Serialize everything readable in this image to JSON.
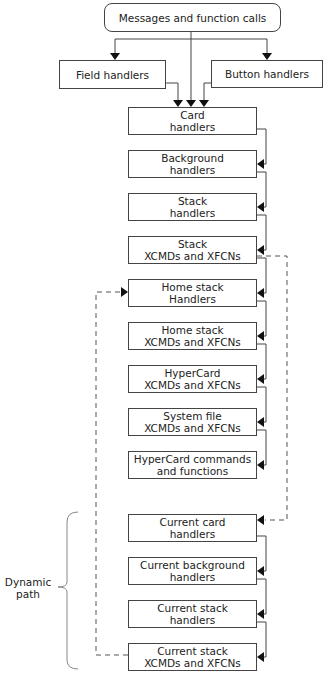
{
  "diagram": {
    "source": {
      "label": "Messages and function calls",
      "x": 104,
      "y": 3,
      "w": 177,
      "h": 29
    },
    "side_nodes": [
      {
        "id": "field",
        "label": "Field handlers",
        "x": 59,
        "y": 60,
        "w": 107,
        "h": 29
      },
      {
        "id": "button",
        "label": "Button handlers",
        "x": 211,
        "y": 60,
        "w": 112,
        "h": 28
      }
    ],
    "static_path": [
      {
        "id": "card",
        "label": "Card\nhandlers",
        "y": 107
      },
      {
        "id": "background",
        "label": "Background\nhandlers",
        "y": 150
      },
      {
        "id": "stack",
        "label": "Stack\nhandlers",
        "y": 193
      },
      {
        "id": "stack-xcmds",
        "label": "Stack\nXCMDs and XFCNs",
        "y": 236
      },
      {
        "id": "home-handlers",
        "label": "Home stack\nHandlers",
        "y": 279
      },
      {
        "id": "home-xcmds",
        "label": "Home stack\nXCMDs and XFCNs",
        "y": 322
      },
      {
        "id": "hypercard-xcmds",
        "label": "HyperCard\nXCMDs and XFCNs",
        "y": 365
      },
      {
        "id": "system-xcmds",
        "label": "System file\nXCMDs and XFCNs",
        "y": 408
      },
      {
        "id": "hypercard-commands",
        "label": "HyperCard commands\nand functions",
        "y": 451
      }
    ],
    "dynamic_path": [
      {
        "id": "current-card",
        "label": "Current card\nhandlers",
        "y": 514
      },
      {
        "id": "current-background",
        "label": "Current background\nhandlers",
        "y": 557
      },
      {
        "id": "current-stack",
        "label": "Current stack\nhandlers",
        "y": 600
      },
      {
        "id": "current-stack-xcmds",
        "label": "Current stack\nXCMDs and XFCNs",
        "y": 643
      }
    ],
    "column": {
      "x": 128,
      "w": 129,
      "h": 28
    },
    "bracket_label": "Dynamic\npath",
    "colors": {
      "line": "#444444",
      "dashed": "#555555",
      "bracket": "#888888"
    }
  }
}
